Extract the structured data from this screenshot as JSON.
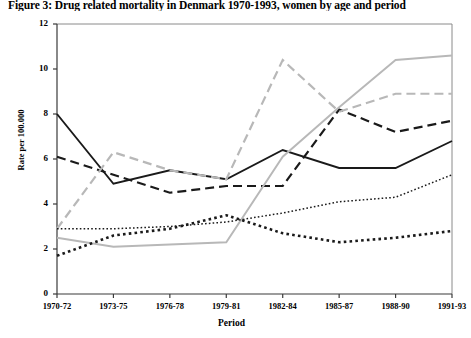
{
  "chart_data": {
    "type": "line",
    "title": "Figure 3: Drug related mortality in Denmark 1970-1993, women by age and period",
    "xlabel": "Period",
    "ylabel": "Rate per 100.000",
    "categories": [
      "1970-72",
      "1973-75",
      "1976-78",
      "1979-81",
      "1982-84",
      "1985-87",
      "1988-90",
      "1991-93"
    ],
    "ylim": [
      0,
      12
    ],
    "yticks": [
      0,
      2,
      4,
      6,
      8,
      10,
      12
    ],
    "grid": false,
    "legend": "none",
    "series": [
      {
        "name": "solid-black",
        "style": "solid",
        "color": "#1a1a1a",
        "values": [
          8.0,
          4.9,
          5.5,
          5.1,
          6.4,
          5.6,
          5.6,
          6.8
        ]
      },
      {
        "name": "dashed-black",
        "style": "dashed",
        "color": "#1a1a1a",
        "values": [
          6.1,
          5.3,
          4.5,
          4.8,
          4.8,
          8.2,
          7.2,
          7.7
        ]
      },
      {
        "name": "dashed-gray",
        "style": "dashed",
        "color": "#b8b8b8",
        "values": [
          2.9,
          6.3,
          5.5,
          5.1,
          10.4,
          8.1,
          8.9,
          8.9
        ]
      },
      {
        "name": "solid-gray",
        "style": "solid",
        "color": "#b8b8b8",
        "values": [
          2.5,
          2.1,
          2.2,
          2.3,
          6.1,
          8.3,
          10.4,
          10.6
        ]
      },
      {
        "name": "dotted-fine-black",
        "style": "dotted-fine",
        "color": "#1a1a1a",
        "values": [
          2.9,
          2.9,
          3.0,
          3.2,
          3.6,
          4.1,
          4.3,
          5.3
        ]
      },
      {
        "name": "dotted-coarse-black",
        "style": "dotted-coarse",
        "color": "#1a1a1a",
        "values": [
          1.7,
          2.6,
          2.9,
          3.5,
          2.7,
          2.3,
          2.5,
          2.8
        ]
      }
    ]
  }
}
